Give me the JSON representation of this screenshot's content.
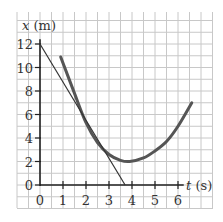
{
  "chart_data": {
    "type": "line",
    "title": "",
    "xlabel": "t (s)",
    "ylabel": "x (m)",
    "xlabel_var": "t",
    "xlabel_unit": "(s)",
    "ylabel_var": "x",
    "ylabel_unit": "(m)",
    "x_ticks": [
      "0",
      "1",
      "2",
      "3",
      "4",
      "5",
      "6"
    ],
    "y_ticks": [
      "0",
      "2",
      "4",
      "6",
      "8",
      "10",
      "12"
    ],
    "xlim": [
      0,
      6.5
    ],
    "ylim": [
      0,
      12.5
    ],
    "grid": true,
    "grid_step_x": 0.5,
    "grid_step_y": 1,
    "legend": null,
    "series": [
      {
        "name": "position curve",
        "style": "thick-gray",
        "color": "#555555",
        "x": [
          0.9,
          1.5,
          2.0,
          2.5,
          3.0,
          3.5,
          3.9,
          4.5,
          5.0,
          5.5,
          6.0,
          6.6
        ],
        "y": [
          10.9,
          7.8,
          5.3,
          3.6,
          2.6,
          2.1,
          2.0,
          2.3,
          2.9,
          3.7,
          5.0,
          7.0
        ]
      },
      {
        "name": "tangent line at t=2 s",
        "style": "thin-dark",
        "color": "#333333",
        "x": [
          0,
          3.7
        ],
        "y": [
          12,
          0
        ]
      }
    ]
  }
}
